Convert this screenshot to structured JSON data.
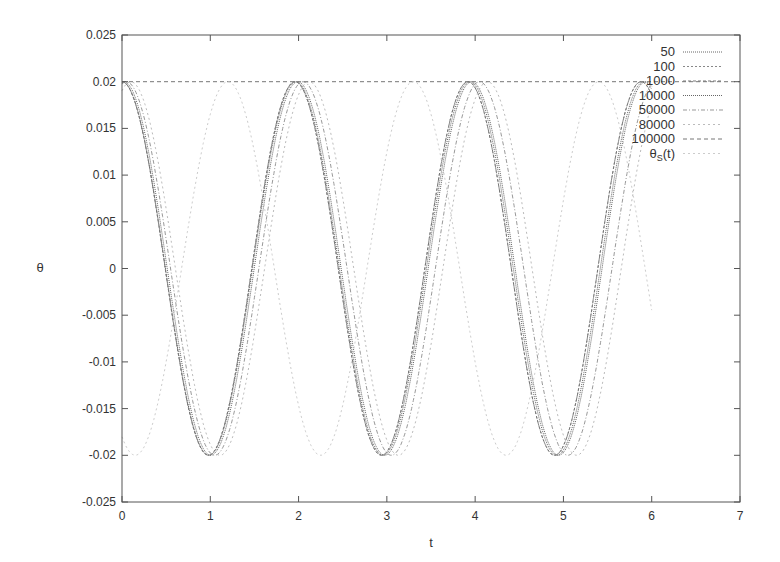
{
  "chart_data": {
    "type": "line",
    "title": "",
    "xlabel": "t",
    "ylabel": "θ",
    "xlim": [
      0,
      7
    ],
    "ylim": [
      -0.025,
      0.025
    ],
    "grid": false,
    "legend_position": "top-right inside",
    "x_ticks": [
      "0",
      "1",
      "2",
      "3",
      "4",
      "5",
      "6",
      "7"
    ],
    "y_ticks": [
      "-0.025",
      "-0.02",
      "-0.015",
      "-0.01",
      "-0.005",
      "0",
      "0.005",
      "0.01",
      "0.015",
      "0.02",
      "0.025"
    ],
    "series": [
      {
        "name": "50",
        "amplitude": 0.02,
        "period": 1.97,
        "phase_shift": 0.0,
        "t_max": 6.0,
        "color": "#666666",
        "dash": "1,1"
      },
      {
        "name": "100",
        "amplitude": 0.02,
        "period": 1.96,
        "phase_shift": 0.0,
        "t_max": 6.0,
        "color": "#888888",
        "dash": "2,2"
      },
      {
        "name": "1000",
        "amplitude": 0.02,
        "period": 1.96,
        "phase_shift": 0.0,
        "t_max": 6.0,
        "color": "#777777",
        "dash": "3,2"
      },
      {
        "name": "10000",
        "amplitude": 0.02,
        "period": 1.97,
        "phase_shift": 0.02,
        "t_max": 6.0,
        "color": "#666666",
        "dash": "1,1"
      },
      {
        "name": "50000",
        "amplitude": 0.02,
        "period": 2.0,
        "phase_shift": 0.05,
        "t_max": 6.0,
        "color": "#999999",
        "dash": "4,2,1,2"
      },
      {
        "name": "80000",
        "amplitude": 0.02,
        "period": 2.02,
        "phase_shift": 0.1,
        "t_max": 6.0,
        "color": "#bbbbbb",
        "dash": "2,3"
      },
      {
        "name": "100000",
        "amplitude": 0.02,
        "period": 1.96,
        "phase_shift": 0.0,
        "t_max": 7.0,
        "constant": 0.02,
        "color": "#777777",
        "dash": "4,3"
      },
      {
        "name": "θs(t)",
        "amplitude": 0.02,
        "period": 2.1,
        "phase_shift": 1.2,
        "t_max": 6.0,
        "color": "#cccccc",
        "dash": "2,3"
      }
    ],
    "annotations": [
      {
        "type": "hline",
        "y": 0.02,
        "style": "dashed",
        "series": "100000"
      }
    ],
    "key_points": {
      "maxima_t": [
        0,
        1.96,
        3.92,
        5.88
      ],
      "minima_t": [
        0.98,
        2.94,
        4.9
      ],
      "max_value": 0.02,
      "min_value": -0.02
    }
  },
  "legend": {
    "entries": [
      "50",
      "100",
      "1000",
      "10000",
      "50000",
      "80000",
      "100000",
      "θ"
    ],
    "theta_subscript": "S",
    "theta_suffix": "(t)"
  }
}
